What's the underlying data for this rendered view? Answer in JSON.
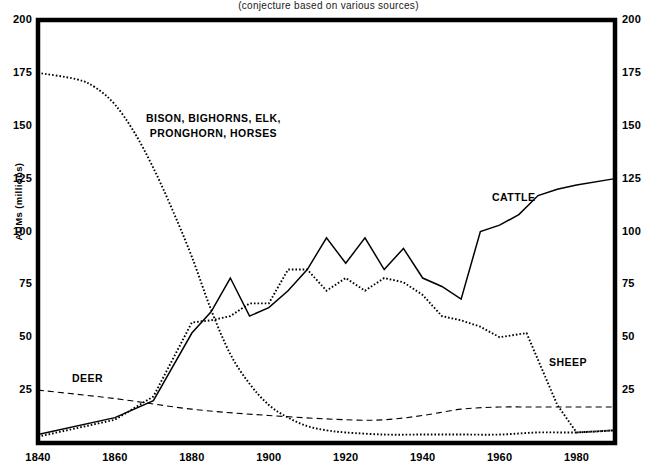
{
  "figure": {
    "clipped_title_fragment": "RANGELAND FORAGE USE",
    "subtitle": "(conjecture based on various sources)",
    "y_axis_label": "AUMs  (millions)",
    "y_ticks": [
      200,
      175,
      150,
      125,
      100,
      75,
      50,
      25
    ],
    "x_ticks": [
      1840,
      1860,
      1880,
      1900,
      1920,
      1940,
      1960,
      1980
    ],
    "series_labels": {
      "wildlife_line1": "BISON, BIGHORNS, ELK,",
      "wildlife_line2": "PRONGHORN, HORSES",
      "cattle": "CATTLE",
      "sheep": "SHEEP",
      "deer": "DEER"
    },
    "colors": {
      "ink": "#000000",
      "background": "#ffffff",
      "frame": "#000000"
    }
  },
  "chart_data": {
    "type": "line",
    "title": "RANGELAND FORAGE USE",
    "subtitle": "(conjecture based on various sources)",
    "xlabel": "",
    "ylabel": "AUMs (millions)",
    "xlim": [
      1840,
      1990
    ],
    "ylim": [
      0,
      200
    ],
    "yticks": [
      0,
      25,
      50,
      75,
      100,
      125,
      150,
      175,
      200
    ],
    "xticks": [
      1840,
      1860,
      1880,
      1900,
      1920,
      1940,
      1960,
      1980
    ],
    "grid": false,
    "legend": "inline annotations",
    "series": [
      {
        "name": "BISON, BIGHORNS, ELK, PRONGHORN, HORSES",
        "style": "dotted",
        "x": [
          1840,
          1850,
          1855,
          1860,
          1865,
          1870,
          1875,
          1880,
          1885,
          1890,
          1895,
          1900,
          1905,
          1910,
          1915,
          1920,
          1930,
          1940,
          1950,
          1960,
          1970,
          1980,
          1990
        ],
        "y": [
          175,
          172,
          168,
          160,
          147,
          130,
          110,
          88,
          63,
          42,
          28,
          18,
          12,
          8,
          6,
          5,
          4,
          4,
          4,
          4,
          5,
          5,
          6
        ]
      },
      {
        "name": "CATTLE",
        "style": "solid",
        "x": [
          1840,
          1860,
          1870,
          1880,
          1885,
          1890,
          1895,
          1900,
          1905,
          1910,
          1915,
          1920,
          1925,
          1930,
          1935,
          1940,
          1945,
          1950,
          1955,
          1960,
          1965,
          1970,
          1975,
          1980,
          1990
        ],
        "y": [
          4,
          12,
          20,
          52,
          62,
          78,
          60,
          64,
          72,
          82,
          97,
          85,
          97,
          82,
          92,
          78,
          74,
          68,
          100,
          103,
          108,
          117,
          120,
          122,
          125
        ]
      },
      {
        "name": "SHEEP",
        "style": "dotted",
        "x": [
          1840,
          1860,
          1870,
          1880,
          1885,
          1890,
          1895,
          1900,
          1905,
          1910,
          1915,
          1920,
          1925,
          1930,
          1935,
          1940,
          1945,
          1950,
          1955,
          1960,
          1967,
          1975,
          1980,
          1990
        ],
        "y": [
          3,
          11,
          22,
          57,
          58,
          60,
          66,
          66,
          82,
          82,
          72,
          78,
          72,
          78,
          76,
          70,
          60,
          58,
          55,
          50,
          52,
          18,
          5,
          6
        ]
      },
      {
        "name": "DEER",
        "style": "dashed",
        "x": [
          1840,
          1860,
          1880,
          1900,
          1920,
          1930,
          1940,
          1950,
          1960,
          1970,
          1980,
          1990
        ],
        "y": [
          25,
          21,
          16,
          13,
          11,
          11,
          13,
          16,
          17,
          17,
          17,
          17
        ]
      }
    ]
  }
}
